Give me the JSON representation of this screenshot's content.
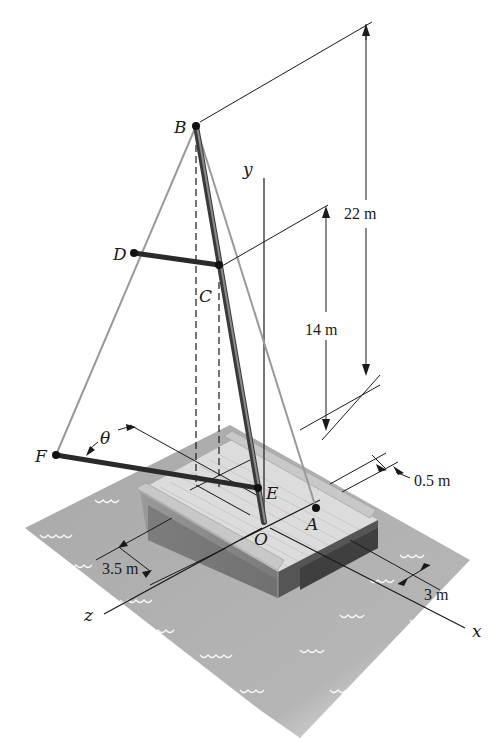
{
  "figure": {
    "colors": {
      "water": "#a9a9a9",
      "water_light": "#c4c4c4",
      "wave": "#ffffff",
      "hull_top": "#d9d9d9",
      "hull_side": "#707070",
      "hull_shadow": "#4a4a4a",
      "rail": "#c8c8c8",
      "mast": "#555555",
      "cable": "#9a9a9a",
      "line": "#1a1a1a"
    }
  },
  "points": {
    "B": "B",
    "C": "C",
    "D": "D",
    "E": "E",
    "F": "F",
    "A": "A",
    "O": "O"
  },
  "axes": {
    "x": "x",
    "y": "y",
    "z": "z"
  },
  "angle": {
    "theta": "θ"
  },
  "dimensions": {
    "height_B": "22 m",
    "height_C": "14 m",
    "offset": "0.5 m",
    "width_x": "3 m",
    "depth_z": "3.5 m"
  }
}
